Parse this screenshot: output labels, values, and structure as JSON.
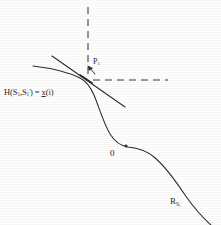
{
  "figure": {
    "background_color": "#ffffff",
    "ink_color": "#2b2b2b",
    "width": 221,
    "height": 225,
    "labels": {
      "h_equation": {
        "prefix": "H(S",
        "sub1": "1",
        "mid": ",S",
        "sub2": "1",
        "prime": "'",
        "close": ") = ",
        "x_var": "x",
        "x_arg": "(i)",
        "plain": "H(S1,S1') = x(i)"
      },
      "p1": {
        "base": "P",
        "sub": "1",
        "plain": "P1"
      },
      "zero": {
        "text": "0"
      },
      "region": {
        "base": "R",
        "sub_base": "S",
        "sub_sub": "i",
        "prime": "'",
        "plain": "RS i'"
      }
    },
    "elements": {
      "curve_name": "descending-s-curve",
      "tangent_name": "tangent-line",
      "dashed_vertical_name": "dashed-vertical-axis",
      "dashed_horizontal_name": "dashed-horizontal-axis",
      "arrow_name": "p1-arrow",
      "tangency_point_name": "tangency-point",
      "curve_marker_name": "curve-dot-marker"
    },
    "geometry": {
      "tangency_point": [
        88,
        80
      ],
      "dashed_vertical": [
        [
          88,
          7
        ],
        [
          88,
          78
        ]
      ],
      "dashed_horizontal": [
        [
          92,
          80
        ],
        [
          168,
          80
        ]
      ],
      "curve_start": [
        33,
        66
      ],
      "curve_end": [
        212,
        225
      ],
      "tangent_start": [
        52,
        56
      ],
      "tangent_end": [
        125,
        107
      ],
      "dot_marker": [
        126,
        146
      ]
    }
  }
}
